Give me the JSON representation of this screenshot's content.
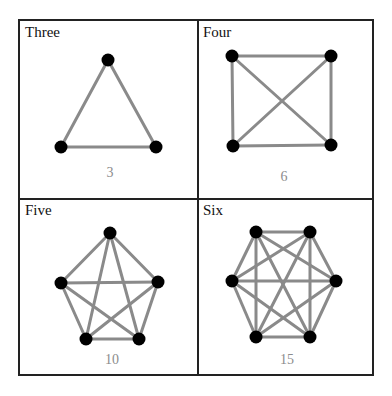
{
  "figure": {
    "panels": [
      {
        "title": "Three",
        "count": "3",
        "vertices": 3,
        "nodes": [
          [
            108,
            60
          ],
          [
            61,
            147
          ],
          [
            156,
            147
          ]
        ],
        "count_pos": [
          110,
          177
        ]
      },
      {
        "title": "Four",
        "count": "6",
        "vertices": 4,
        "nodes": [
          [
            232,
            56
          ],
          [
            331,
            56
          ],
          [
            331,
            145
          ],
          [
            233,
            146
          ]
        ],
        "count_pos": [
          284,
          181
        ]
      },
      {
        "title": "Five",
        "count": "10",
        "vertices": 5,
        "nodes": [
          [
            110,
            233
          ],
          [
            158,
            282
          ],
          [
            139,
            339
          ],
          [
            86,
            339
          ],
          [
            61,
            283
          ]
        ],
        "count_pos": [
          112,
          364
        ]
      },
      {
        "title": "Six",
        "count": "15",
        "vertices": 6,
        "nodes": [
          [
            256,
            232
          ],
          [
            310,
            232
          ],
          [
            336,
            281
          ],
          [
            310,
            337
          ],
          [
            256,
            337
          ],
          [
            232,
            281
          ]
        ],
        "count_pos": [
          287,
          364
        ]
      }
    ],
    "colors": {
      "edge": "#8a8a8a",
      "node": "#000000",
      "border": "#222222",
      "count_text": "#8c8c8c"
    }
  }
}
